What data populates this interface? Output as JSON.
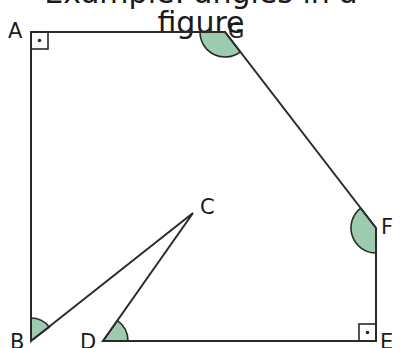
{
  "figure": {
    "title_partial": "Example: angles in a figure",
    "colors": {
      "stroke": "#2a2a2a",
      "angle_fill": "#9ccbb0",
      "background": "#ffffff"
    },
    "vertices": {
      "A": {
        "label": "A",
        "x": 31,
        "y": 32
      },
      "G": {
        "label": "G",
        "x": 225,
        "y": 32
      },
      "F": {
        "label": "F",
        "x": 376,
        "y": 228
      },
      "E": {
        "label": "E",
        "x": 376,
        "y": 341
      },
      "D": {
        "label": "D",
        "x": 103,
        "y": 341
      },
      "C": {
        "label": "C",
        "x": 193,
        "y": 213
      },
      "B": {
        "label": "B",
        "x": 31,
        "y": 341
      }
    },
    "right_angles": [
      "A",
      "E"
    ],
    "marked_angles": [
      "G",
      "F",
      "B",
      "D"
    ]
  }
}
